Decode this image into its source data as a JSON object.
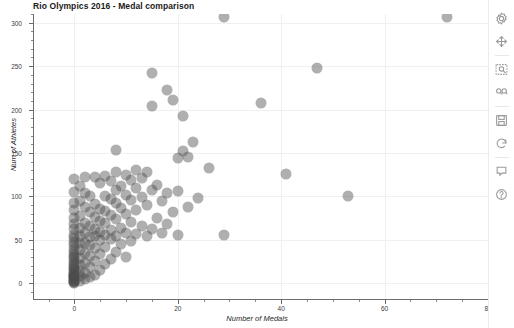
{
  "chart_data": {
    "type": "scatter",
    "title": "Rio Olympics 2016 - Medal comparison",
    "xlabel": "Number of Medals",
    "ylabel": "Num of Athletes",
    "xlim": [
      -8,
      80
    ],
    "ylim": [
      -18,
      310
    ],
    "xticks": [
      0,
      20,
      40,
      60,
      80
    ],
    "xtick_labels": [
      "0",
      "20",
      "40",
      "60",
      "80"
    ],
    "yticks": [
      0,
      50,
      100,
      150,
      200,
      250,
      300
    ],
    "ytick_labels": [
      "0",
      "50",
      "100",
      "150",
      "200",
      "250",
      "300"
    ],
    "grid": true,
    "legend": "none",
    "marker_color": "#4d4d4d",
    "marker_alpha": 0.45,
    "marker_size": 11,
    "points": [
      {
        "x": 0,
        "y": 0
      },
      {
        "x": 0,
        "y": 1
      },
      {
        "x": 0,
        "y": 2
      },
      {
        "x": 0,
        "y": 3
      },
      {
        "x": 0,
        "y": 4
      },
      {
        "x": 0,
        "y": 5
      },
      {
        "x": 0,
        "y": 6
      },
      {
        "x": 0,
        "y": 7
      },
      {
        "x": 0,
        "y": 8
      },
      {
        "x": 0,
        "y": 9
      },
      {
        "x": 0,
        "y": 10
      },
      {
        "x": 0,
        "y": 11
      },
      {
        "x": 0,
        "y": 12
      },
      {
        "x": 0,
        "y": 14
      },
      {
        "x": 0,
        "y": 16
      },
      {
        "x": 0,
        "y": 18
      },
      {
        "x": 0,
        "y": 20
      },
      {
        "x": 0,
        "y": 22
      },
      {
        "x": 0,
        "y": 25
      },
      {
        "x": 0,
        "y": 28
      },
      {
        "x": 0,
        "y": 30
      },
      {
        "x": 0,
        "y": 33
      },
      {
        "x": 0,
        "y": 36
      },
      {
        "x": 0,
        "y": 40
      },
      {
        "x": 0,
        "y": 44
      },
      {
        "x": 0,
        "y": 48
      },
      {
        "x": 0,
        "y": 52
      },
      {
        "x": 0,
        "y": 56
      },
      {
        "x": 0,
        "y": 62
      },
      {
        "x": 0,
        "y": 68
      },
      {
        "x": 0,
        "y": 75
      },
      {
        "x": 0,
        "y": 84
      },
      {
        "x": 0,
        "y": 92
      },
      {
        "x": 0,
        "y": 105
      },
      {
        "x": 0,
        "y": 120
      },
      {
        "x": 1,
        "y": 3
      },
      {
        "x": 1,
        "y": 8
      },
      {
        "x": 1,
        "y": 14
      },
      {
        "x": 1,
        "y": 21
      },
      {
        "x": 1,
        "y": 29
      },
      {
        "x": 1,
        "y": 38
      },
      {
        "x": 1,
        "y": 46
      },
      {
        "x": 1,
        "y": 55
      },
      {
        "x": 1,
        "y": 64
      },
      {
        "x": 1,
        "y": 78
      },
      {
        "x": 1,
        "y": 95
      },
      {
        "x": 1,
        "y": 112
      },
      {
        "x": 2,
        "y": 5
      },
      {
        "x": 2,
        "y": 12
      },
      {
        "x": 2,
        "y": 24
      },
      {
        "x": 2,
        "y": 35
      },
      {
        "x": 2,
        "y": 47
      },
      {
        "x": 2,
        "y": 58
      },
      {
        "x": 2,
        "y": 70
      },
      {
        "x": 2,
        "y": 88
      },
      {
        "x": 2,
        "y": 104
      },
      {
        "x": 2,
        "y": 122
      },
      {
        "x": 3,
        "y": 7
      },
      {
        "x": 3,
        "y": 19
      },
      {
        "x": 3,
        "y": 31
      },
      {
        "x": 3,
        "y": 44
      },
      {
        "x": 3,
        "y": 53
      },
      {
        "x": 3,
        "y": 66
      },
      {
        "x": 3,
        "y": 82
      },
      {
        "x": 3,
        "y": 101
      },
      {
        "x": 4,
        "y": 10
      },
      {
        "x": 4,
        "y": 26
      },
      {
        "x": 4,
        "y": 41
      },
      {
        "x": 4,
        "y": 54
      },
      {
        "x": 4,
        "y": 63
      },
      {
        "x": 4,
        "y": 76
      },
      {
        "x": 4,
        "y": 91
      },
      {
        "x": 4,
        "y": 122
      },
      {
        "x": 5,
        "y": 15
      },
      {
        "x": 5,
        "y": 34
      },
      {
        "x": 5,
        "y": 50
      },
      {
        "x": 5,
        "y": 59
      },
      {
        "x": 5,
        "y": 72
      },
      {
        "x": 5,
        "y": 86
      },
      {
        "x": 5,
        "y": 116
      },
      {
        "x": 6,
        "y": 22
      },
      {
        "x": 6,
        "y": 42
      },
      {
        "x": 6,
        "y": 56
      },
      {
        "x": 6,
        "y": 69
      },
      {
        "x": 6,
        "y": 83
      },
      {
        "x": 6,
        "y": 100
      },
      {
        "x": 6,
        "y": 123
      },
      {
        "x": 7,
        "y": 28
      },
      {
        "x": 7,
        "y": 51
      },
      {
        "x": 7,
        "y": 61
      },
      {
        "x": 7,
        "y": 79
      },
      {
        "x": 7,
        "y": 97
      },
      {
        "x": 7,
        "y": 118
      },
      {
        "x": 8,
        "y": 36
      },
      {
        "x": 8,
        "y": 55
      },
      {
        "x": 8,
        "y": 74
      },
      {
        "x": 8,
        "y": 93
      },
      {
        "x": 8,
        "y": 108
      },
      {
        "x": 8,
        "y": 128
      },
      {
        "x": 8,
        "y": 153
      },
      {
        "x": 9,
        "y": 45
      },
      {
        "x": 9,
        "y": 64
      },
      {
        "x": 9,
        "y": 87
      },
      {
        "x": 9,
        "y": 112
      },
      {
        "x": 10,
        "y": 30
      },
      {
        "x": 10,
        "y": 58
      },
      {
        "x": 10,
        "y": 80
      },
      {
        "x": 10,
        "y": 102
      },
      {
        "x": 10,
        "y": 125
      },
      {
        "x": 11,
        "y": 49
      },
      {
        "x": 11,
        "y": 71
      },
      {
        "x": 11,
        "y": 96
      },
      {
        "x": 11,
        "y": 119
      },
      {
        "x": 12,
        "y": 57
      },
      {
        "x": 12,
        "y": 85
      },
      {
        "x": 12,
        "y": 110
      },
      {
        "x": 12,
        "y": 131
      },
      {
        "x": 13,
        "y": 66
      },
      {
        "x": 13,
        "y": 99
      },
      {
        "x": 13,
        "y": 121
      },
      {
        "x": 14,
        "y": 54
      },
      {
        "x": 14,
        "y": 90
      },
      {
        "x": 14,
        "y": 128
      },
      {
        "x": 15,
        "y": 62
      },
      {
        "x": 15,
        "y": 107
      },
      {
        "x": 15,
        "y": 204
      },
      {
        "x": 15,
        "y": 242
      },
      {
        "x": 16,
        "y": 75
      },
      {
        "x": 16,
        "y": 113
      },
      {
        "x": 17,
        "y": 58
      },
      {
        "x": 17,
        "y": 95
      },
      {
        "x": 18,
        "y": 68
      },
      {
        "x": 18,
        "y": 104
      },
      {
        "x": 18,
        "y": 222
      },
      {
        "x": 19,
        "y": 82
      },
      {
        "x": 19,
        "y": 211
      },
      {
        "x": 20,
        "y": 56
      },
      {
        "x": 20,
        "y": 106
      },
      {
        "x": 20,
        "y": 144
      },
      {
        "x": 21,
        "y": 152
      },
      {
        "x": 21,
        "y": 193
      },
      {
        "x": 22,
        "y": 88
      },
      {
        "x": 22,
        "y": 146
      },
      {
        "x": 23,
        "y": 163
      },
      {
        "x": 24,
        "y": 98
      },
      {
        "x": 26,
        "y": 133
      },
      {
        "x": 29,
        "y": 56
      },
      {
        "x": 36,
        "y": 207
      },
      {
        "x": 41,
        "y": 126
      },
      {
        "x": 47,
        "y": 248
      },
      {
        "x": 53,
        "y": 101
      },
      {
        "x": 29,
        "y": 307
      },
      {
        "x": 72,
        "y": 307
      }
    ]
  },
  "toolbar": {
    "items": [
      {
        "icon": "settings-gear-icon",
        "label": "Settings"
      },
      {
        "icon": "move-pan-icon",
        "label": "Pan"
      },
      {
        "icon": "zoom-selection-icon",
        "label": "Zoom to selection"
      },
      {
        "icon": "box-zoom-icon",
        "label": "Box zoom"
      },
      {
        "icon": "save-disk-icon",
        "label": "Save"
      },
      {
        "icon": "reset-refresh-icon",
        "label": "Reset"
      },
      {
        "icon": "hover-tooltip-icon",
        "label": "Hover"
      },
      {
        "icon": "help-question-icon",
        "label": "Help"
      }
    ]
  }
}
